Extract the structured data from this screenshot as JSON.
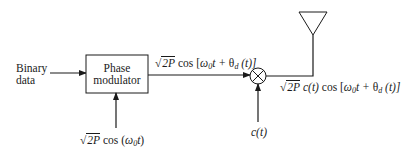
{
  "diagram": {
    "type": "block-diagram",
    "blocks": {
      "phase_modulator": {
        "line1": "Phase",
        "line2": "modulator"
      }
    },
    "inputs": {
      "binary_data": {
        "line1": "Binary",
        "line2": "data"
      },
      "carrier": {
        "coef": "2P",
        "func": "cos (",
        "omega": "ω",
        "sub": "0",
        "t": "t",
        "close": ")"
      },
      "code": {
        "c": "c",
        "open": "(",
        "t": "t",
        "close": ")"
      }
    },
    "signals": {
      "modulator_out": {
        "coef": "2P",
        "text": "cos [",
        "omega": "ω",
        "sub": "0",
        "t": "t +",
        "theta": "θ",
        "thsub": "d",
        "arg": " (t)]"
      },
      "spread_out": {
        "coef": "2P",
        "ct": "c(t)",
        "text": "cos [",
        "omega": "ω",
        "sub": "0",
        "t": "t +",
        "theta": "θ",
        "thsub": "d",
        "arg": " (t)]"
      }
    },
    "components": {
      "multiplier": "⊗",
      "antenna": "antenna"
    },
    "colors": {
      "ink": "#1a1a1a",
      "background": "#ffffff"
    }
  }
}
